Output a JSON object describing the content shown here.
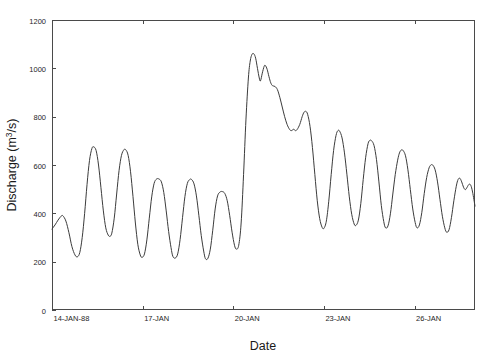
{
  "chart_data": {
    "type": "line",
    "title": "",
    "subtitle": "",
    "xlabel": "Date",
    "ylabel": "Discharge (m3/s)",
    "ylabel_parts": {
      "pre": "Discharge (m",
      "sup": "3",
      "post": "/s)"
    },
    "ylim": [
      0,
      1200
    ],
    "yticks": [
      0,
      200,
      400,
      600,
      800,
      1000,
      1200
    ],
    "ytick_labels": [
      "0",
      "200",
      "400",
      "600",
      "800",
      "1000",
      "1200"
    ],
    "xlim_days": [
      0,
      14
    ],
    "xticks_days": [
      0,
      3,
      6,
      9,
      12
    ],
    "xtick_labels": [
      "14-JAN-88",
      "17-JAN",
      "20-JAN",
      "23-JAN",
      "26-JAN"
    ],
    "grid": false,
    "legend": false,
    "legend_position": "none",
    "line_color": "#3b3b3b",
    "frame_color": "#4a4a4a",
    "background_color": "#ffffff",
    "series": [
      {
        "name": "Discharge",
        "units": "m3/s",
        "x_units": "days since 14-JAN-88",
        "x": [
          0.0,
          0.12,
          0.25,
          0.38,
          0.5,
          0.62,
          0.72,
          0.82,
          0.92,
          1.02,
          1.1,
          1.18,
          1.26,
          1.34,
          1.42,
          1.52,
          1.62,
          1.72,
          1.82,
          1.92,
          2.02,
          2.1,
          2.18,
          2.26,
          2.34,
          2.44,
          2.54,
          2.64,
          2.74,
          2.84,
          2.94,
          3.04,
          3.12,
          3.2,
          3.28,
          3.38,
          3.48,
          3.58,
          3.68,
          3.78,
          3.88,
          3.98,
          4.06,
          4.14,
          4.22,
          4.32,
          4.42,
          4.52,
          4.62,
          4.72,
          4.82,
          4.92,
          5.0,
          5.08,
          5.16,
          5.26,
          5.36,
          5.46,
          5.56,
          5.66,
          5.76,
          5.86,
          5.94,
          6.02,
          6.12,
          6.22,
          6.32,
          6.2,
          6.3,
          5.96,
          6.04,
          6.1,
          5.9,
          5.98,
          5.8,
          5.88,
          5.7,
          5.6,
          5.5,
          5.4
        ],
        "x_ordered": true,
        "values_note": "See points[] for the authoritative ordered (day, discharge) pairs.",
        "points": [
          [
            0.0,
            335
          ],
          [
            0.1,
            352
          ],
          [
            0.2,
            372
          ],
          [
            0.3,
            388
          ],
          [
            0.36,
            390
          ],
          [
            0.46,
            368
          ],
          [
            0.56,
            320
          ],
          [
            0.66,
            262
          ],
          [
            0.76,
            228
          ],
          [
            0.84,
            220
          ],
          [
            0.92,
            238
          ],
          [
            1.0,
            300
          ],
          [
            1.08,
            400
          ],
          [
            1.16,
            520
          ],
          [
            1.24,
            618
          ],
          [
            1.32,
            668
          ],
          [
            1.38,
            675
          ],
          [
            1.46,
            660
          ],
          [
            1.54,
            600
          ],
          [
            1.62,
            506
          ],
          [
            1.7,
            410
          ],
          [
            1.78,
            340
          ],
          [
            1.86,
            310
          ],
          [
            1.92,
            305
          ],
          [
            1.98,
            318
          ],
          [
            2.06,
            380
          ],
          [
            2.14,
            480
          ],
          [
            2.22,
            578
          ],
          [
            2.3,
            640
          ],
          [
            2.38,
            663
          ],
          [
            2.44,
            663
          ],
          [
            2.52,
            640
          ],
          [
            2.6,
            572
          ],
          [
            2.68,
            470
          ],
          [
            2.76,
            360
          ],
          [
            2.84,
            272
          ],
          [
            2.92,
            228
          ],
          [
            2.98,
            218
          ],
          [
            3.06,
            232
          ],
          [
            3.14,
            290
          ],
          [
            3.22,
            380
          ],
          [
            3.3,
            468
          ],
          [
            3.38,
            524
          ],
          [
            3.46,
            542
          ],
          [
            3.54,
            542
          ],
          [
            3.62,
            530
          ],
          [
            3.7,
            486
          ],
          [
            3.78,
            410
          ],
          [
            3.86,
            325
          ],
          [
            3.94,
            258
          ],
          [
            4.0,
            222
          ],
          [
            4.08,
            215
          ],
          [
            4.16,
            232
          ],
          [
            4.24,
            292
          ],
          [
            4.32,
            382
          ],
          [
            4.4,
            470
          ],
          [
            4.48,
            524
          ],
          [
            4.56,
            540
          ],
          [
            4.62,
            540
          ],
          [
            4.7,
            522
          ],
          [
            4.78,
            472
          ],
          [
            4.86,
            392
          ],
          [
            4.94,
            308
          ],
          [
            5.02,
            244
          ],
          [
            5.08,
            212
          ],
          [
            5.16,
            214
          ],
          [
            5.24,
            252
          ],
          [
            5.32,
            330
          ],
          [
            5.4,
            418
          ],
          [
            5.48,
            472
          ],
          [
            5.56,
            488
          ],
          [
            5.64,
            490
          ],
          [
            5.72,
            482
          ],
          [
            5.8,
            452
          ],
          [
            5.88,
            392
          ],
          [
            5.96,
            322
          ],
          [
            6.04,
            268
          ],
          [
            6.1,
            252
          ],
          [
            6.18,
            268
          ],
          [
            6.26,
            360
          ],
          [
            6.34,
            560
          ],
          [
            6.42,
            790
          ],
          [
            6.5,
            960
          ],
          [
            6.56,
            1030
          ],
          [
            6.62,
            1058
          ],
          [
            6.68,
            1060
          ],
          [
            6.74,
            1042
          ],
          [
            6.8,
            1000
          ],
          [
            6.86,
            960
          ],
          [
            6.9,
            948
          ],
          [
            6.96,
            980
          ],
          [
            7.02,
            1008
          ],
          [
            7.06,
            1012
          ],
          [
            7.12,
            996
          ],
          [
            7.18,
            966
          ],
          [
            7.24,
            940
          ],
          [
            7.3,
            928
          ],
          [
            7.38,
            925
          ],
          [
            7.46,
            912
          ],
          [
            7.54,
            880
          ],
          [
            7.62,
            840
          ],
          [
            7.7,
            800
          ],
          [
            7.78,
            768
          ],
          [
            7.86,
            748
          ],
          [
            7.92,
            742
          ],
          [
            8.0,
            748
          ],
          [
            8.06,
            742
          ],
          [
            8.12,
            748
          ],
          [
            8.2,
            768
          ],
          [
            8.28,
            800
          ],
          [
            8.34,
            818
          ],
          [
            8.4,
            822
          ],
          [
            8.46,
            810
          ],
          [
            8.54,
            760
          ],
          [
            8.62,
            672
          ],
          [
            8.7,
            560
          ],
          [
            8.78,
            452
          ],
          [
            8.86,
            378
          ],
          [
            8.94,
            342
          ],
          [
            9.0,
            338
          ],
          [
            9.08,
            368
          ],
          [
            9.16,
            450
          ],
          [
            9.24,
            560
          ],
          [
            9.32,
            660
          ],
          [
            9.4,
            722
          ],
          [
            9.46,
            742
          ],
          [
            9.52,
            740
          ],
          [
            9.6,
            712
          ],
          [
            9.68,
            650
          ],
          [
            9.76,
            562
          ],
          [
            9.84,
            468
          ],
          [
            9.92,
            396
          ],
          [
            10.0,
            356
          ],
          [
            10.06,
            350
          ],
          [
            10.14,
            372
          ],
          [
            10.22,
            440
          ],
          [
            10.3,
            540
          ],
          [
            10.38,
            630
          ],
          [
            10.46,
            688
          ],
          [
            10.52,
            702
          ],
          [
            10.58,
            700
          ],
          [
            10.66,
            680
          ],
          [
            10.74,
            622
          ],
          [
            10.82,
            530
          ],
          [
            10.9,
            432
          ],
          [
            10.98,
            366
          ],
          [
            11.04,
            340
          ],
          [
            11.12,
            348
          ],
          [
            11.2,
            398
          ],
          [
            11.28,
            480
          ],
          [
            11.36,
            560
          ],
          [
            11.44,
            620
          ],
          [
            11.5,
            650
          ],
          [
            11.56,
            662
          ],
          [
            11.62,
            660
          ],
          [
            11.7,
            638
          ],
          [
            11.78,
            580
          ],
          [
            11.86,
            498
          ],
          [
            11.94,
            418
          ],
          [
            12.02,
            362
          ],
          [
            12.08,
            340
          ],
          [
            12.16,
            352
          ],
          [
            12.24,
            404
          ],
          [
            12.32,
            482
          ],
          [
            12.4,
            548
          ],
          [
            12.48,
            588
          ],
          [
            12.54,
            600
          ],
          [
            12.6,
            600
          ],
          [
            12.68,
            580
          ],
          [
            12.76,
            530
          ],
          [
            12.84,
            458
          ],
          [
            12.92,
            388
          ],
          [
            13.0,
            340
          ],
          [
            13.06,
            322
          ],
          [
            13.14,
            332
          ],
          [
            13.22,
            382
          ],
          [
            13.3,
            452
          ],
          [
            13.38,
            512
          ],
          [
            13.44,
            540
          ],
          [
            13.5,
            545
          ],
          [
            13.56,
            530
          ],
          [
            13.62,
            508
          ],
          [
            13.68,
            498
          ],
          [
            13.74,
            508
          ],
          [
            13.8,
            520
          ],
          [
            13.86,
            516
          ],
          [
            13.92,
            488
          ],
          [
            14.0,
            430
          ],
          [
            14.08,
            366
          ],
          [
            14.16,
            318
          ],
          [
            14.22,
            300
          ],
          [
            14.28,
            318
          ],
          [
            14.34,
            380
          ],
          [
            14.4,
            460
          ],
          [
            14.44,
            512
          ],
          [
            14.48,
            532
          ]
        ],
        "summary": {
          "min": 208,
          "max": 1060,
          "start": 335,
          "end": 532,
          "peak_day_label": "20-JAN",
          "baseline_oscillation_range": [
            208,
            675
          ],
          "recession_oscillation_range": [
            300,
            822
          ]
        }
      }
    ],
    "annotations": []
  },
  "figure": {
    "plot_area": {
      "left": 52,
      "top": 20,
      "right": 475,
      "bottom": 310
    },
    "tick_length": 4
  }
}
